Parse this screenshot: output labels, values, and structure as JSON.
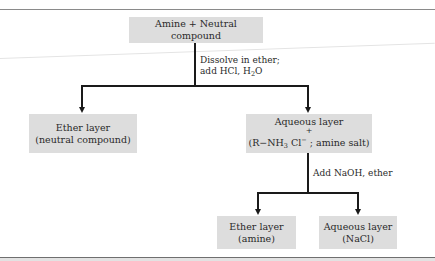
{
  "diagram": {
    "start": {
      "label": "Amine + Neutral compound"
    },
    "step1": {
      "line1": "Dissolve in ether;",
      "line2_prefix": "add HCl, H",
      "line2_sub": "2",
      "line2_suffix": "O"
    },
    "ether_layer_1": {
      "line1": "Ether layer",
      "line2": "(neutral compound)"
    },
    "aqueous_layer_1": {
      "line1": "Aqueous layer",
      "plus": "+",
      "salt_open": "(R−NH",
      "salt_sub": "3",
      "salt_cl": " Cl",
      "salt_sup": "−",
      "salt_close": " ; amine salt)"
    },
    "step2": {
      "label": "Add NaOH, ether"
    },
    "ether_layer_2": {
      "line1": "Ether layer",
      "line2": "(amine)"
    },
    "aqueous_layer_2": {
      "line1": "Aqueous layer",
      "line2": "(NaCl)"
    }
  },
  "colors": {
    "box_fill": "#dddddd",
    "line": "#1a1a1a"
  }
}
